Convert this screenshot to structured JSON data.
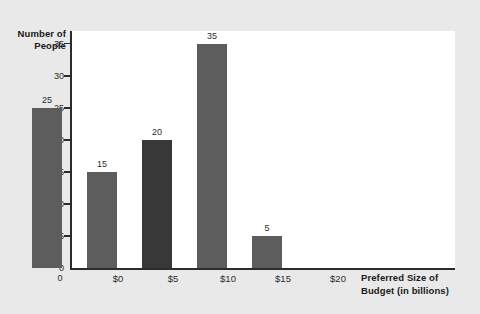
{
  "chart_data": {
    "type": "bar",
    "title": "",
    "subtitle": "",
    "xlabel": "Preferred Size of Budget (in billions)",
    "ylabel": "Number of People",
    "categories": [
      "$0",
      "$5",
      "$10",
      "$15",
      "$20"
    ],
    "values": [
      25,
      15,
      20,
      35,
      5
    ],
    "series": [
      {
        "name": "Number of People",
        "values": [
          25,
          15,
          20,
          35,
          5
        ]
      }
    ],
    "value_labels": [
      "25",
      "15",
      "20",
      "35",
      "5"
    ],
    "bar_colors": [
      "#5d5d5d",
      "#5d5d5d",
      "#383838",
      "#5d5d5d",
      "#5d5d5d"
    ],
    "ylim": [
      0,
      37
    ],
    "yticks": [
      0,
      5,
      10,
      15,
      20,
      25,
      30,
      35
    ],
    "ytick_labels": [
      "0",
      "5",
      "10",
      "15",
      "20",
      "25",
      "30",
      "35"
    ],
    "grid": false,
    "legend": "none",
    "legend_position": "none",
    "plot_background": "#ffffff",
    "figure_background": "#e9e9e9",
    "axis_color": "#2b2b2b"
  },
  "axis": {
    "y_title_line1": "Number of",
    "y_title_line2": "People",
    "x_title_line1": "Preferred Size of",
    "x_title_line2": "Budget (in billions)",
    "origin_label": "0"
  }
}
